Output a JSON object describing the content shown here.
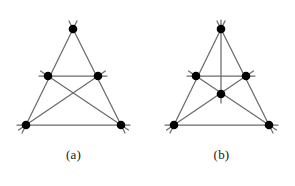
{
  "document": {
    "kind": "geometric-configuration-figure",
    "background_color": "#ffffff",
    "line_color": "#6b6b6b",
    "vertex_color": "#000000",
    "caption_color": "#1a1a1a"
  },
  "figures": [
    {
      "id": "a",
      "caption": "(a)",
      "description": "Triangle configuration with five points",
      "point_count": "5",
      "line_count": "5",
      "points": [
        {
          "name": "top",
          "x": 73,
          "y": 29
        },
        {
          "name": "middle-left",
          "x": 48,
          "y": 76
        },
        {
          "name": "middle-right",
          "x": 98,
          "y": 76
        },
        {
          "name": "bottom-left",
          "x": 26,
          "y": 125
        },
        {
          "name": "bottom-right",
          "x": 121,
          "y": 125
        }
      ],
      "lines": [
        {
          "name": "left-side",
          "from": "top",
          "to": "bottom-left"
        },
        {
          "name": "right-side",
          "from": "top",
          "to": "bottom-right"
        },
        {
          "name": "base",
          "from": "bottom-left",
          "to": "bottom-right"
        },
        {
          "name": "midline",
          "from": "middle-left",
          "to": "middle-right"
        },
        {
          "name": "diagonal-left",
          "from": "middle-left",
          "to": "bottom-right"
        },
        {
          "name": "diagonal-right",
          "from": "middle-right",
          "to": "bottom-left"
        }
      ]
    },
    {
      "id": "b",
      "caption": "(b)",
      "description": "Triangle configuration with six points and a vertical axis",
      "point_count": "6",
      "line_count": "6",
      "points": [
        {
          "name": "top",
          "x": 73,
          "y": 29
        },
        {
          "name": "middle-left",
          "x": 48,
          "y": 76
        },
        {
          "name": "middle-right",
          "x": 98,
          "y": 76
        },
        {
          "name": "center",
          "x": 73,
          "y": 94
        },
        {
          "name": "bottom-left",
          "x": 26,
          "y": 125
        },
        {
          "name": "bottom-right",
          "x": 121,
          "y": 125
        }
      ],
      "lines": [
        {
          "name": "left-side",
          "from": "top",
          "to": "bottom-left"
        },
        {
          "name": "right-side",
          "from": "top",
          "to": "bottom-right"
        },
        {
          "name": "base",
          "from": "bottom-left",
          "to": "bottom-right"
        },
        {
          "name": "midline",
          "from": "middle-left",
          "to": "middle-right"
        },
        {
          "name": "vertical-axis",
          "from": "top",
          "to": "center"
        },
        {
          "name": "diagonal-left",
          "from": "middle-left",
          "to": "bottom-right"
        },
        {
          "name": "diagonal-right",
          "from": "middle-right",
          "to": "bottom-left"
        }
      ]
    }
  ]
}
